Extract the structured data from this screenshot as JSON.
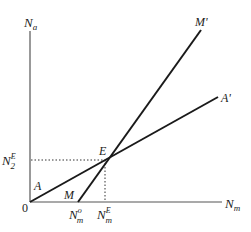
{
  "diagram": {
    "type": "economic-equilibrium-diagram",
    "axes": {
      "y_label": {
        "base": "N",
        "sub": "a"
      },
      "x_label": {
        "base": "N",
        "sub": "m"
      },
      "origin_label": "0"
    },
    "lines": [
      {
        "id": "AA",
        "start_label": "A",
        "end_label": "A'",
        "description": "line from origin rising with shallow slope"
      },
      {
        "id": "MM",
        "start_label": "M",
        "end_label": "M'",
        "description": "steeper line starting at N_m^o on the horizontal axis"
      }
    ],
    "equilibrium": {
      "label": "E",
      "y_tick": {
        "base": "N",
        "sub": "2",
        "sup": "E"
      },
      "x_tick": {
        "base": "N",
        "sub": "m",
        "sup": "E"
      }
    },
    "x_ticks": [
      {
        "base": "N",
        "sub": "m",
        "sup": "o"
      },
      {
        "base": "N",
        "sub": "m",
        "sup": "E"
      }
    ],
    "colors": {
      "line": "#1a1a1a",
      "axis": "#555555",
      "dotted": "#333333"
    }
  }
}
